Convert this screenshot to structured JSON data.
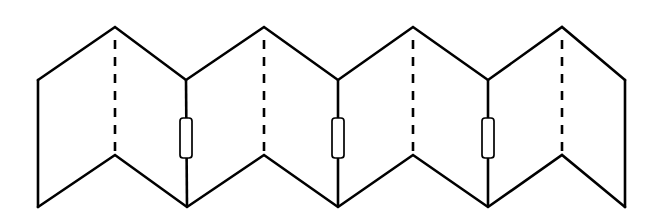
{
  "figure": {
    "background_color": "#ffffff",
    "stroke_color": "#000000",
    "dashed_stroke_color": "#000000",
    "width": 661,
    "height": 222
  },
  "artifact": {
    "ghost_text_label": "scan-bleed-through-text",
    "ghost_text": "         ",
    "color": "#d8d8d8"
  },
  "geometry": {
    "peak_y": 27,
    "shoulder_y": 80,
    "upper_valley_y": 155,
    "bottom_y": 207,
    "clip_top_y": 118,
    "clip_bottom_y": 158,
    "left_edge_x": 38,
    "right_edge_x": 625,
    "peaks_x": [
      115,
      264,
      413,
      562
    ],
    "joints_x": [
      186,
      338,
      488
    ],
    "clip_width": 12,
    "clip_height": 40,
    "stroke_width": 2.6,
    "dash_pattern": "9 8",
    "dash_width": 2.6
  },
  "elements": {
    "outline_label": "zigzag-outline",
    "fold_line_label": "dashed-fold-line",
    "joint_label": "vertical-joint-line",
    "clip_label": "connector-clip",
    "panel_count": 8,
    "fold_count": 4,
    "clip_count": 3
  }
}
